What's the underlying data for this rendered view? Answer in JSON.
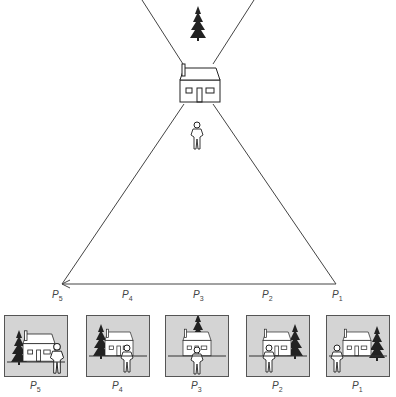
{
  "diagram": {
    "objects": {
      "tree": "tree-icon",
      "house": "house-icon",
      "person": "person-icon"
    },
    "path_points": [
      {
        "letter": "P",
        "sub": "5"
      },
      {
        "letter": "P",
        "sub": "4"
      },
      {
        "letter": "P",
        "sub": "3"
      },
      {
        "letter": "P",
        "sub": "2"
      },
      {
        "letter": "P",
        "sub": "1"
      }
    ],
    "views": [
      {
        "letter": "P",
        "sub": "5"
      },
      {
        "letter": "P",
        "sub": "4"
      },
      {
        "letter": "P",
        "sub": "3"
      },
      {
        "letter": "P",
        "sub": "2"
      },
      {
        "letter": "P",
        "sub": "1"
      }
    ]
  }
}
